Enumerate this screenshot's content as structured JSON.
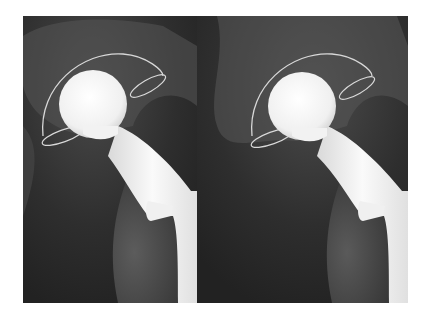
{
  "figure": {
    "panels": [
      {
        "id": "left",
        "label": ""
      },
      {
        "id": "right",
        "label": ""
      }
    ],
    "colors": {
      "background": "#ffffff",
      "film_dark": "#262626",
      "bone_gray": "#5a5a5a",
      "implant_white": "#f2f2f2"
    }
  }
}
